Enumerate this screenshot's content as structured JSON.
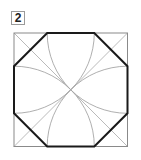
{
  "figure": {
    "label": "2",
    "square": {
      "x": 14,
      "y": 33,
      "size": 113.5
    },
    "colors": {
      "square_stroke": "#8a8a8a",
      "octagon_stroke": "#1a1a1a",
      "construction_stroke": "#9a9a9a",
      "label_border": "#9a9a9a"
    }
  }
}
